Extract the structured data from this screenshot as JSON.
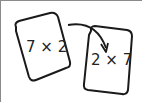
{
  "diagram": {
    "cards": [
      {
        "label": "7 × 2",
        "rotation": "tilted left"
      },
      {
        "label": "2 × 7",
        "rotation": "tilted right"
      }
    ],
    "arrow": {
      "from": "card 1",
      "to": "card 2",
      "style": "curved"
    },
    "colors": {
      "stroke": "#1a1a1a",
      "background": "#ffffff",
      "frame": "#8a8a8a"
    }
  }
}
